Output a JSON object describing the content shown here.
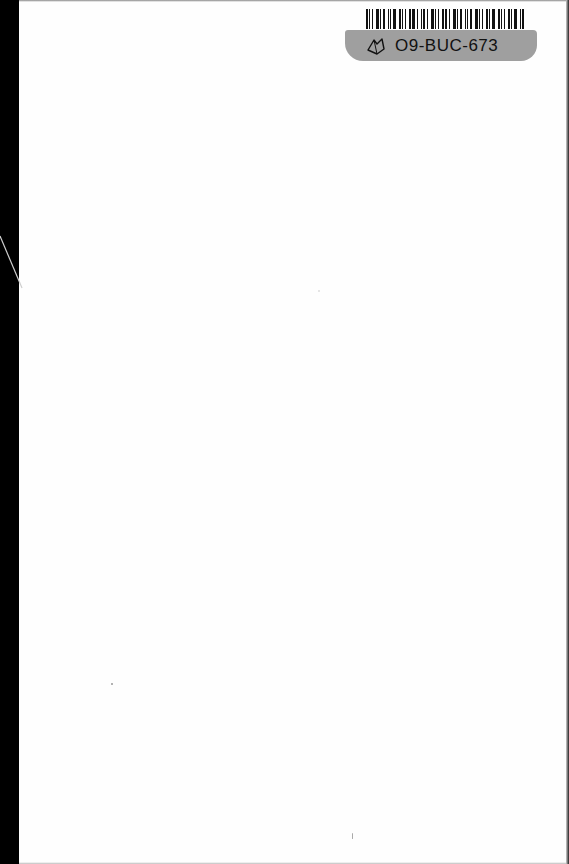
{
  "document": {
    "type": "scanned blank book page",
    "barcode_label": {
      "code": "O9-BUC-673",
      "icon": "library-book-icon",
      "band_color": "#9f9f9f"
    },
    "edges": {
      "left_color": "#000000",
      "page_color": "#ffffff"
    }
  }
}
